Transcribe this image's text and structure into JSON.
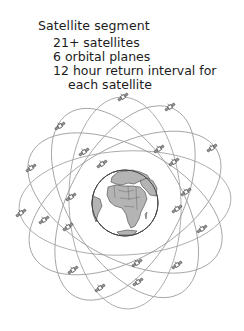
{
  "caption": {
    "title": "Satellite segment",
    "lines": [
      "21+ satellites",
      "6 orbital planes",
      "12 hour return interval for",
      "each satellite"
    ]
  },
  "diagram": {
    "globe": {
      "cx": 125,
      "cy": 203,
      "r": 33,
      "ocean_color": "#ffffff",
      "land_color": "#b4b4b4",
      "outline_color": "#444444"
    },
    "orbit_color": "#9a9a9a",
    "orbits": [
      {
        "rx": 106,
        "ry": 52,
        "rotation": -3
      },
      {
        "rx": 106,
        "ry": 56,
        "rotation": 28
      },
      {
        "rx": 106,
        "ry": 56,
        "rotation": 58
      },
      {
        "rx": 106,
        "ry": 56,
        "rotation": 88
      },
      {
        "rx": 106,
        "ry": 56,
        "rotation": 118
      },
      {
        "rx": 106,
        "ry": 56,
        "rotation": 150
      }
    ],
    "satellites": [
      [
        123,
        97
      ],
      [
        170,
        107
      ],
      [
        60,
        126
      ],
      [
        84,
        152
      ],
      [
        159,
        149
      ],
      [
        212,
        148
      ],
      [
        31,
        168
      ],
      [
        102,
        164
      ],
      [
        174,
        162
      ],
      [
        71,
        197
      ],
      [
        186,
        192
      ],
      [
        21,
        213
      ],
      [
        44,
        220
      ],
      [
        177,
        209
      ],
      [
        68,
        227
      ],
      [
        202,
        229
      ],
      [
        137,
        263
      ],
      [
        177,
        265
      ],
      [
        73,
        270
      ],
      [
        100,
        288
      ],
      [
        138,
        282
      ]
    ]
  }
}
